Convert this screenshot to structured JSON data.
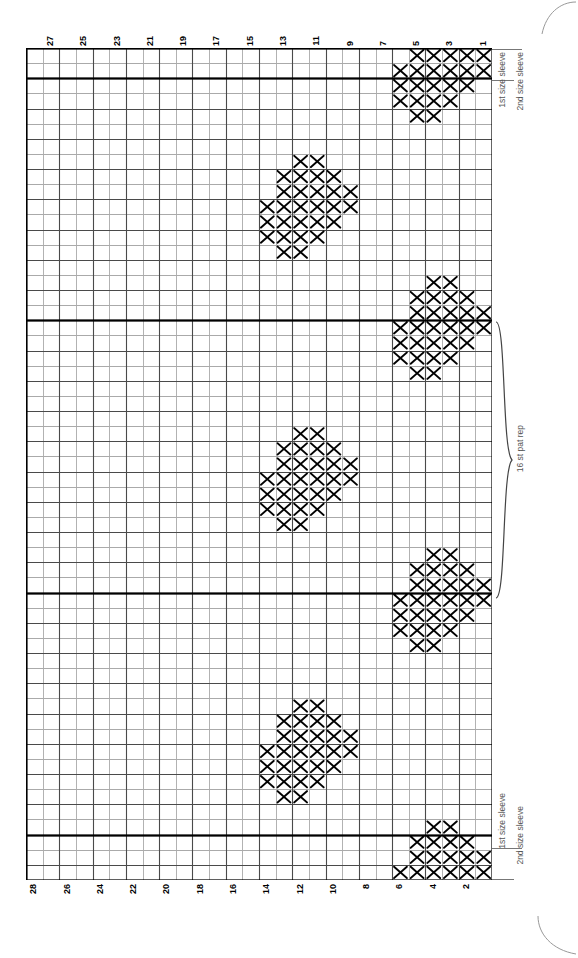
{
  "chart": {
    "type": "knitting-chart",
    "symbol": "X",
    "columns": 28,
    "rows": 55,
    "column_numbers_top": [
      27,
      25,
      23,
      21,
      19,
      17,
      15,
      13,
      11,
      9,
      7,
      5,
      3,
      1
    ],
    "column_numbers_bottom": [
      28,
      26,
      24,
      22,
      20,
      18,
      16,
      14,
      12,
      10,
      8,
      6,
      4,
      2
    ],
    "column_order": "right-to-left",
    "pattern_repeat_label": "16 st pat rep",
    "size_labels": {
      "first": "1st size sleeve",
      "second": "2nd size sleeve"
    },
    "grid_color_light": "#aaaaaa",
    "grid_color_heavy": "#000000",
    "symbol_color": "#000000"
  },
  "chart_data": {
    "type": "heatmap",
    "xlabel": "",
    "ylabel": "",
    "grid": true,
    "legend": [],
    "categories": [
      "28",
      "27",
      "26",
      "25",
      "24",
      "23",
      "22",
      "21",
      "20",
      "19",
      "18",
      "17",
      "16",
      "15",
      "14",
      "13",
      "12",
      "11",
      "10",
      "9",
      "8",
      "7",
      "6",
      "5",
      "4",
      "3",
      "2",
      "1"
    ],
    "cols": 28,
    "rows": 55,
    "note": "Each entry is [row_index, col_index_from_right_starting_at_0] of a filled X cell.",
    "filled_cells": [
      [
        0,
        0
      ],
      [
        0,
        1
      ],
      [
        0,
        2
      ],
      [
        0,
        3
      ],
      [
        0,
        4
      ],
      [
        1,
        0
      ],
      [
        1,
        1
      ],
      [
        1,
        2
      ],
      [
        1,
        3
      ],
      [
        1,
        4
      ],
      [
        1,
        5
      ],
      [
        2,
        1
      ],
      [
        2,
        2
      ],
      [
        2,
        3
      ],
      [
        2,
        4
      ],
      [
        2,
        5
      ],
      [
        3,
        2
      ],
      [
        3,
        3
      ],
      [
        3,
        4
      ],
      [
        3,
        5
      ],
      [
        4,
        3
      ],
      [
        4,
        4
      ],
      [
        7,
        10
      ],
      [
        7,
        11
      ],
      [
        8,
        9
      ],
      [
        8,
        10
      ],
      [
        8,
        11
      ],
      [
        8,
        12
      ],
      [
        9,
        8
      ],
      [
        9,
        9
      ],
      [
        9,
        10
      ],
      [
        9,
        11
      ],
      [
        9,
        12
      ],
      [
        10,
        8
      ],
      [
        10,
        9
      ],
      [
        10,
        10
      ],
      [
        10,
        11
      ],
      [
        10,
        12
      ],
      [
        10,
        13
      ],
      [
        11,
        9
      ],
      [
        11,
        10
      ],
      [
        11,
        11
      ],
      [
        11,
        12
      ],
      [
        11,
        13
      ],
      [
        12,
        10
      ],
      [
        12,
        11
      ],
      [
        12,
        12
      ],
      [
        12,
        13
      ],
      [
        13,
        11
      ],
      [
        13,
        12
      ],
      [
        15,
        2
      ],
      [
        15,
        3
      ],
      [
        16,
        1
      ],
      [
        16,
        2
      ],
      [
        16,
        3
      ],
      [
        16,
        4
      ],
      [
        17,
        0
      ],
      [
        17,
        1
      ],
      [
        17,
        2
      ],
      [
        17,
        3
      ],
      [
        17,
        4
      ],
      [
        18,
        0
      ],
      [
        18,
        1
      ],
      [
        18,
        2
      ],
      [
        18,
        3
      ],
      [
        18,
        4
      ],
      [
        18,
        5
      ],
      [
        19,
        1
      ],
      [
        19,
        2
      ],
      [
        19,
        3
      ],
      [
        19,
        4
      ],
      [
        19,
        5
      ],
      [
        20,
        2
      ],
      [
        20,
        3
      ],
      [
        20,
        4
      ],
      [
        20,
        5
      ],
      [
        21,
        3
      ],
      [
        21,
        4
      ],
      [
        25,
        10
      ],
      [
        25,
        11
      ],
      [
        26,
        9
      ],
      [
        26,
        10
      ],
      [
        26,
        11
      ],
      [
        26,
        12
      ],
      [
        27,
        8
      ],
      [
        27,
        9
      ],
      [
        27,
        10
      ],
      [
        27,
        11
      ],
      [
        27,
        12
      ],
      [
        28,
        8
      ],
      [
        28,
        9
      ],
      [
        28,
        10
      ],
      [
        28,
        11
      ],
      [
        28,
        12
      ],
      [
        28,
        13
      ],
      [
        29,
        9
      ],
      [
        29,
        10
      ],
      [
        29,
        11
      ],
      [
        29,
        12
      ],
      [
        29,
        13
      ],
      [
        30,
        10
      ],
      [
        30,
        11
      ],
      [
        30,
        12
      ],
      [
        30,
        13
      ],
      [
        31,
        11
      ],
      [
        31,
        12
      ],
      [
        33,
        2
      ],
      [
        33,
        3
      ],
      [
        34,
        1
      ],
      [
        34,
        2
      ],
      [
        34,
        3
      ],
      [
        34,
        4
      ],
      [
        35,
        0
      ],
      [
        35,
        1
      ],
      [
        35,
        2
      ],
      [
        35,
        3
      ],
      [
        35,
        4
      ],
      [
        36,
        0
      ],
      [
        36,
        1
      ],
      [
        36,
        2
      ],
      [
        36,
        3
      ],
      [
        36,
        4
      ],
      [
        36,
        5
      ],
      [
        37,
        1
      ],
      [
        37,
        2
      ],
      [
        37,
        3
      ],
      [
        37,
        4
      ],
      [
        37,
        5
      ],
      [
        38,
        2
      ],
      [
        38,
        3
      ],
      [
        38,
        4
      ],
      [
        38,
        5
      ],
      [
        39,
        3
      ],
      [
        39,
        4
      ],
      [
        43,
        10
      ],
      [
        43,
        11
      ],
      [
        44,
        9
      ],
      [
        44,
        10
      ],
      [
        44,
        11
      ],
      [
        44,
        12
      ],
      [
        45,
        8
      ],
      [
        45,
        9
      ],
      [
        45,
        10
      ],
      [
        45,
        11
      ],
      [
        45,
        12
      ],
      [
        46,
        8
      ],
      [
        46,
        9
      ],
      [
        46,
        10
      ],
      [
        46,
        11
      ],
      [
        46,
        12
      ],
      [
        46,
        13
      ],
      [
        47,
        9
      ],
      [
        47,
        10
      ],
      [
        47,
        11
      ],
      [
        47,
        12
      ],
      [
        47,
        13
      ],
      [
        48,
        10
      ],
      [
        48,
        11
      ],
      [
        48,
        12
      ],
      [
        48,
        13
      ],
      [
        49,
        11
      ],
      [
        49,
        12
      ],
      [
        51,
        2
      ],
      [
        51,
        3
      ],
      [
        52,
        1
      ],
      [
        52,
        2
      ],
      [
        52,
        3
      ],
      [
        52,
        4
      ],
      [
        53,
        0
      ],
      [
        53,
        1
      ],
      [
        53,
        2
      ],
      [
        53,
        3
      ],
      [
        53,
        4
      ],
      [
        54,
        0
      ],
      [
        54,
        1
      ],
      [
        54,
        2
      ],
      [
        54,
        3
      ],
      [
        54,
        4
      ],
      [
        54,
        5
      ]
    ],
    "heavy_row_lines": [
      0,
      2,
      18,
      36,
      52,
      55
    ],
    "heavy_col_lines": [
      0,
      28
    ]
  }
}
